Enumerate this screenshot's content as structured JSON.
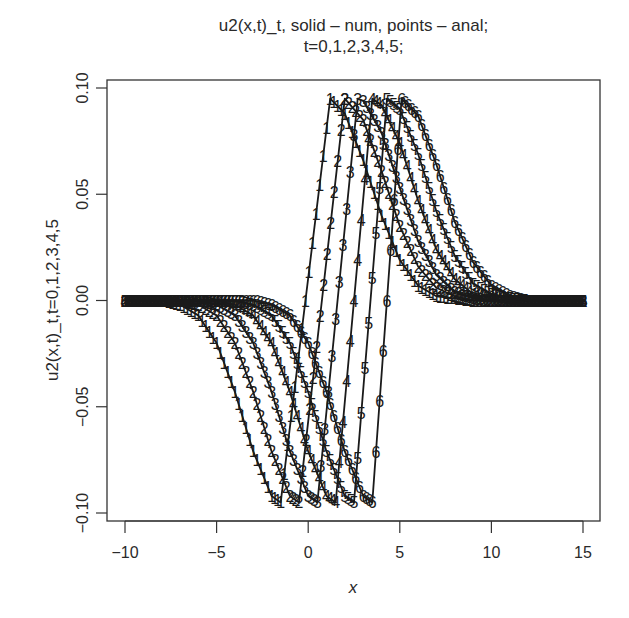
{
  "chart_data": {
    "type": "line",
    "title": "u2(x,t)_t, solid – num, points – anal;",
    "subtitle": "t=0,1,2,3,4,5;",
    "xlabel": "x",
    "ylabel": "u2(x,t)_t,t=0,1,2,3,4,5",
    "xlim": [
      -11,
      16
    ],
    "ylim": [
      -0.105,
      0.105
    ],
    "x_ticks": [
      -10,
      -5,
      0,
      5,
      10,
      15
    ],
    "x_tick_labels": [
      "−10",
      "−5",
      "0",
      "5",
      "10",
      "15"
    ],
    "y_ticks": [
      -0.1,
      -0.05,
      0.0,
      0.05,
      0.1
    ],
    "y_tick_labels": [
      "−0.10",
      "−0.05",
      "0.00",
      "0.05",
      "0.10"
    ],
    "grid": false,
    "legend": "none (series marked by digit point symbols 1–6)",
    "x": [
      -10,
      -9,
      -8,
      -7,
      -6,
      -5,
      -4,
      -3,
      -2,
      -1,
      0,
      1,
      2,
      3,
      4,
      5,
      6,
      7,
      8,
      9,
      10,
      11,
      12,
      13,
      14,
      15
    ],
    "series": [
      {
        "name": "t=0",
        "marker": "1",
        "min_x": -1.5,
        "max_x": 1.2,
        "values": [
          0,
          0,
          0,
          -0.002,
          -0.007,
          -0.02,
          -0.043,
          -0.071,
          -0.092,
          -0.06,
          0.011,
          0.081,
          0.088,
          0.066,
          0.04,
          0.019,
          0.007,
          0.002,
          0.001,
          0,
          0,
          0,
          0,
          0,
          0,
          0
        ]
      },
      {
        "name": "t=1",
        "marker": "2",
        "min_x": -0.5,
        "max_x": 2.0,
        "values": [
          0,
          0,
          0,
          0,
          -0.002,
          -0.007,
          -0.02,
          -0.043,
          -0.071,
          -0.092,
          -0.057,
          0.019,
          0.095,
          0.085,
          0.061,
          0.035,
          0.016,
          0.006,
          0.002,
          0,
          0,
          0,
          0,
          0,
          0,
          0
        ]
      },
      {
        "name": "t=2",
        "marker": "3",
        "min_x": 0.5,
        "max_x": 2.7,
        "values": [
          0,
          0,
          0,
          0,
          0,
          -0.002,
          -0.007,
          -0.02,
          -0.043,
          -0.071,
          -0.092,
          -0.052,
          0.035,
          0.094,
          0.079,
          0.053,
          0.028,
          0.012,
          0.004,
          0.001,
          0,
          0,
          0,
          0,
          0,
          0
        ]
      },
      {
        "name": "t=3",
        "marker": "4",
        "min_x": 1.5,
        "max_x": 3.5,
        "values": [
          0,
          0,
          0,
          0,
          0,
          0,
          -0.002,
          -0.007,
          -0.02,
          -0.043,
          -0.071,
          -0.092,
          -0.048,
          0.048,
          0.092,
          0.074,
          0.047,
          0.024,
          0.01,
          0.003,
          0.001,
          0,
          0,
          0,
          0,
          0
        ]
      },
      {
        "name": "t=4",
        "marker": "5",
        "min_x": 2.5,
        "max_x": 4.3,
        "values": [
          0,
          0,
          0,
          0,
          0,
          0,
          0,
          -0.002,
          -0.007,
          -0.02,
          -0.043,
          -0.071,
          -0.092,
          -0.042,
          0.063,
          0.09,
          0.069,
          0.042,
          0.021,
          0.008,
          0.003,
          0.001,
          0,
          0,
          0,
          0
        ]
      },
      {
        "name": "t=5",
        "marker": "6",
        "min_x": 3.5,
        "max_x": 5.1,
        "values": [
          0,
          0,
          0,
          0,
          0,
          0,
          0,
          0,
          -0.002,
          -0.007,
          -0.02,
          -0.043,
          -0.071,
          -0.092,
          -0.036,
          0.083,
          0.087,
          0.064,
          0.037,
          0.018,
          0.007,
          0.002,
          0,
          0,
          0,
          0
        ]
      }
    ],
    "extremum": {
      "min_y": -0.095,
      "max_y": 0.095
    }
  }
}
